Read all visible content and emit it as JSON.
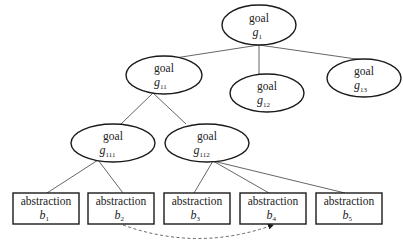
{
  "diagram": {
    "type": "goal-abstraction-tree",
    "goals": [
      {
        "id": "g1",
        "title": "goal",
        "symbol": "g",
        "subscript": "1",
        "cx": 259,
        "cy": 25,
        "rx": 37,
        "ry": 20
      },
      {
        "id": "g11",
        "title": "goal",
        "symbol": "g",
        "subscript": "11",
        "cx": 164,
        "cy": 75,
        "rx": 38,
        "ry": 19
      },
      {
        "id": "g12",
        "title": "goal",
        "symbol": "g",
        "subscript": "12",
        "cx": 267,
        "cy": 93,
        "rx": 37,
        "ry": 19
      },
      {
        "id": "g13",
        "title": "goal",
        "symbol": "g",
        "subscript": "13",
        "cx": 364,
        "cy": 78,
        "rx": 37,
        "ry": 19
      },
      {
        "id": "g111",
        "title": "goal",
        "symbol": "g",
        "subscript": "111",
        "cx": 113,
        "cy": 143,
        "rx": 42,
        "ry": 19
      },
      {
        "id": "g112",
        "title": "goal",
        "symbol": "g",
        "subscript": "112",
        "cx": 207,
        "cy": 143,
        "rx": 42,
        "ry": 19
      }
    ],
    "abstractions": [
      {
        "id": "b1",
        "title": "abstraction",
        "symbol": "b",
        "subscript": "1",
        "x": 13,
        "y": 193,
        "w": 66,
        "h": 31
      },
      {
        "id": "b2",
        "title": "abstraction",
        "symbol": "b",
        "subscript": "2",
        "x": 88,
        "y": 193,
        "w": 66,
        "h": 31
      },
      {
        "id": "b3",
        "title": "abstraction",
        "symbol": "b",
        "subscript": "3",
        "x": 164,
        "y": 193,
        "w": 66,
        "h": 31
      },
      {
        "id": "b4",
        "title": "abstraction",
        "symbol": "b",
        "subscript": "4",
        "x": 240,
        "y": 193,
        "w": 66,
        "h": 31
      },
      {
        "id": "b5",
        "title": "abstraction",
        "symbol": "b",
        "subscript": "5",
        "x": 316,
        "y": 193,
        "w": 66,
        "h": 31
      }
    ],
    "edges": [
      {
        "from": "g1",
        "to": "g11",
        "x1": 259,
        "y1": 45,
        "x2": 175,
        "y2": 58
      },
      {
        "from": "g1",
        "to": "g12",
        "x1": 259,
        "y1": 45,
        "x2": 259,
        "y2": 76
      },
      {
        "from": "g1",
        "to": "g13",
        "x1": 259,
        "y1": 45,
        "x2": 363,
        "y2": 60
      },
      {
        "from": "g11",
        "to": "g111",
        "x1": 153,
        "y1": 93,
        "x2": 121,
        "y2": 124
      },
      {
        "from": "g11",
        "to": "g112",
        "x1": 153,
        "y1": 93,
        "x2": 186,
        "y2": 124
      },
      {
        "from": "g111",
        "to": "b1",
        "x1": 98,
        "y1": 160,
        "x2": 47,
        "y2": 193
      },
      {
        "from": "g111",
        "to": "b2",
        "x1": 98,
        "y1": 160,
        "x2": 123,
        "y2": 193
      },
      {
        "from": "g112",
        "to": "b3",
        "x1": 213,
        "y1": 161,
        "x2": 194,
        "y2": 193
      },
      {
        "from": "g112",
        "to": "b4",
        "x1": 213,
        "y1": 161,
        "x2": 269,
        "y2": 193
      },
      {
        "from": "g112",
        "to": "b5",
        "x1": 213,
        "y1": 161,
        "x2": 345,
        "y2": 193
      }
    ],
    "dashed_link": {
      "from": "b2",
      "to": "b4",
      "style": "dashed-arrow",
      "path": "M 123 225 Q 198 252 273 225"
    }
  }
}
